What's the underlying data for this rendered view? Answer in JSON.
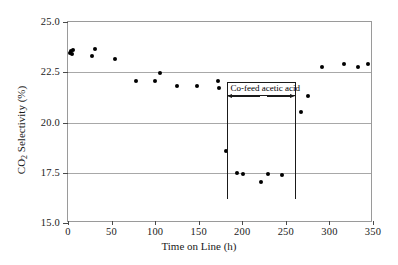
{
  "chart_data": {
    "type": "scatter",
    "title": "",
    "xlabel": "Time on Line (h)",
    "ylabel": "CO2 Selectivity (%)",
    "ylabel_parts": {
      "prefix": "CO",
      "sub": "2",
      "suffix": " Selectivity (%)"
    },
    "xlim": [
      0,
      350
    ],
    "ylim": [
      15.0,
      25.0
    ],
    "xticks": [
      0,
      50,
      100,
      150,
      200,
      250,
      300,
      350
    ],
    "xtick_labels": [
      "0",
      "50",
      "100",
      "150",
      "200",
      "250",
      "300",
      "350"
    ],
    "yticks": [
      15.0,
      17.5,
      20.0,
      22.5,
      25.0
    ],
    "ytick_labels": [
      "15.0",
      "17.5",
      "20.0",
      "22.5",
      "25.0"
    ],
    "grid": true,
    "grid_axis": "y",
    "legend": "none",
    "marker": "filled-circle",
    "marker_color": "#000000",
    "series": [
      {
        "name": "CO2 selectivity",
        "points": [
          {
            "x": 2,
            "y": 23.45
          },
          {
            "x": 4,
            "y": 23.55
          },
          {
            "x": 5,
            "y": 23.4
          },
          {
            "x": 6,
            "y": 23.6
          },
          {
            "x": 27,
            "y": 23.3
          },
          {
            "x": 31,
            "y": 23.65
          },
          {
            "x": 54,
            "y": 23.15
          },
          {
            "x": 78,
            "y": 22.05
          },
          {
            "x": 100,
            "y": 22.05
          },
          {
            "x": 106,
            "y": 22.45
          },
          {
            "x": 125,
            "y": 21.8
          },
          {
            "x": 148,
            "y": 21.8
          },
          {
            "x": 172,
            "y": 22.05
          },
          {
            "x": 173,
            "y": 21.7
          },
          {
            "x": 181,
            "y": 18.6
          },
          {
            "x": 194,
            "y": 17.5
          },
          {
            "x": 201,
            "y": 17.45
          },
          {
            "x": 221,
            "y": 17.05
          },
          {
            "x": 230,
            "y": 17.45
          },
          {
            "x": 246,
            "y": 17.4
          },
          {
            "x": 267,
            "y": 20.5
          },
          {
            "x": 275,
            "y": 21.3
          },
          {
            "x": 291,
            "y": 22.75
          },
          {
            "x": 317,
            "y": 22.9
          },
          {
            "x": 333,
            "y": 22.75
          },
          {
            "x": 344,
            "y": 22.9
          }
        ]
      }
    ],
    "annotations": [
      {
        "type": "span-marker",
        "label": "Co-feed acetic acid",
        "x_start": 183,
        "x_end": 261,
        "y_top": 21.4,
        "y_bottom": 16.2
      }
    ]
  },
  "colors": {
    "marker": "#000000",
    "gridline": "#a8a8a8",
    "frame": "#9a9a9a",
    "annotation": "#1a1a1a",
    "background": "#ffffff"
  }
}
